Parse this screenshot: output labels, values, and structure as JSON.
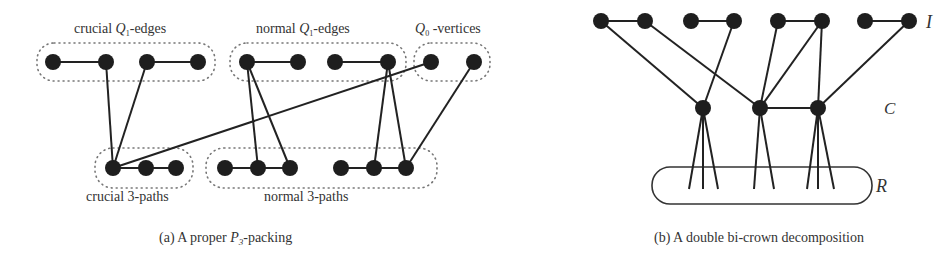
{
  "panel_a": {
    "caption_prefix": "(a) A proper ",
    "caption_var": "P",
    "caption_sub": "3",
    "caption_suffix": "-packing",
    "labels": {
      "crucial_q1_pre": "crucial ",
      "crucial_q1_var": "Q",
      "crucial_q1_sub": "1",
      "crucial_q1_post": "-edges",
      "normal_q1_pre": "normal ",
      "normal_q1_var": "Q",
      "normal_q1_sub": "1",
      "normal_q1_post": "-edges",
      "q0_var": "Q",
      "q0_sub": "0",
      "q0_post": " -vertices",
      "crucial_paths": "crucial 3-paths",
      "normal_paths": "normal 3-paths"
    },
    "vertices": [
      {
        "id": "a1",
        "x": 53,
        "y": 62
      },
      {
        "id": "a2",
        "x": 106,
        "y": 62
      },
      {
        "id": "a3",
        "x": 147,
        "y": 62
      },
      {
        "id": "a4",
        "x": 198,
        "y": 62
      },
      {
        "id": "a5",
        "x": 247,
        "y": 62
      },
      {
        "id": "a6",
        "x": 298,
        "y": 62
      },
      {
        "id": "a7",
        "x": 335,
        "y": 62
      },
      {
        "id": "a8",
        "x": 388,
        "y": 62
      },
      {
        "id": "a9",
        "x": 431,
        "y": 62
      },
      {
        "id": "a10",
        "x": 474,
        "y": 62
      },
      {
        "id": "b1",
        "x": 113,
        "y": 168
      },
      {
        "id": "b2",
        "x": 146,
        "y": 168
      },
      {
        "id": "b3",
        "x": 176,
        "y": 168
      },
      {
        "id": "b4",
        "x": 225,
        "y": 168
      },
      {
        "id": "b5",
        "x": 258,
        "y": 168
      },
      {
        "id": "b6",
        "x": 290,
        "y": 168
      },
      {
        "id": "b7",
        "x": 341,
        "y": 168
      },
      {
        "id": "b8",
        "x": 374,
        "y": 168
      },
      {
        "id": "b9",
        "x": 406,
        "y": 168
      }
    ],
    "edges": [
      [
        "a1",
        "a2"
      ],
      [
        "a3",
        "a4"
      ],
      [
        "a5",
        "a6"
      ],
      [
        "a7",
        "a8"
      ],
      [
        "b1",
        "b2"
      ],
      [
        "b2",
        "b3"
      ],
      [
        "b4",
        "b5"
      ],
      [
        "b5",
        "b6"
      ],
      [
        "b7",
        "b8"
      ],
      [
        "b8",
        "b9"
      ],
      [
        "a2",
        "b1"
      ],
      [
        "a3",
        "b1"
      ],
      [
        "a9",
        "b1"
      ],
      [
        "a5",
        "b5"
      ],
      [
        "a5",
        "b6"
      ],
      [
        "a8",
        "b8"
      ],
      [
        "a8",
        "b9"
      ],
      [
        "a10",
        "b9"
      ]
    ]
  },
  "panel_b": {
    "caption": "(b) A double bi-crown decomposition",
    "label_I": "I",
    "label_C": "C",
    "label_R": "R",
    "vertices_I": [
      {
        "id": "i1",
        "x": 601,
        "y": 21
      },
      {
        "id": "i2",
        "x": 645,
        "y": 21
      },
      {
        "id": "i3",
        "x": 691,
        "y": 21
      },
      {
        "id": "i4",
        "x": 734,
        "y": 21
      },
      {
        "id": "i5",
        "x": 778,
        "y": 21
      },
      {
        "id": "i6",
        "x": 822,
        "y": 21
      },
      {
        "id": "i7",
        "x": 865,
        "y": 21
      },
      {
        "id": "i8",
        "x": 909,
        "y": 21
      }
    ],
    "vertices_C": [
      {
        "id": "c1",
        "x": 703,
        "y": 108
      },
      {
        "id": "c2",
        "x": 760,
        "y": 108
      },
      {
        "id": "c3",
        "x": 818,
        "y": 108
      }
    ],
    "edges": [
      [
        "i1",
        "i2"
      ],
      [
        "i3",
        "i4"
      ],
      [
        "i5",
        "i6"
      ],
      [
        "i7",
        "i8"
      ],
      [
        "i1",
        "c1"
      ],
      [
        "i4",
        "c1"
      ],
      [
        "i2",
        "c2"
      ],
      [
        "i5",
        "c2"
      ],
      [
        "i6",
        "c2"
      ],
      [
        "i6",
        "c3"
      ],
      [
        "i8",
        "c3"
      ],
      [
        "c2",
        "c3"
      ]
    ],
    "r_fans": [
      {
        "from": "c1",
        "ends": [
          689,
          703,
          718
        ]
      },
      {
        "from": "c2",
        "ends": [
          754,
          774
        ]
      },
      {
        "from": "c3",
        "ends": [
          807,
          818,
          834
        ]
      }
    ]
  }
}
